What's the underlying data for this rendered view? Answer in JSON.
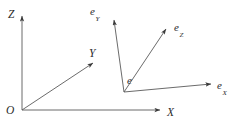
{
  "figure": {
    "type": "diagram",
    "background_color": "#ffffff",
    "line_color": "#555555",
    "text_color": "#2b2b2b",
    "width": 238,
    "height": 131
  },
  "global_frame": {
    "origin": {
      "label": "O",
      "x": 22,
      "y": 110
    },
    "axes": [
      {
        "name": "z-axis",
        "label": "Z",
        "subscript": "",
        "from": [
          22,
          110
        ],
        "to": [
          22,
          16
        ],
        "label_x": 8,
        "label_y": 5
      },
      {
        "name": "y-axis",
        "label": "Y",
        "subscript": "",
        "from": [
          22,
          110
        ],
        "to": [
          93,
          63
        ],
        "label_x": 89,
        "label_y": 44
      },
      {
        "name": "x-axis",
        "label": "X",
        "subscript": "",
        "from": [
          22,
          110
        ],
        "to": [
          160,
          110
        ],
        "label_x": 167,
        "label_y": 103
      }
    ]
  },
  "local_frame": {
    "origin": {
      "label": "e",
      "subscript": "",
      "x": 124,
      "y": 92,
      "label_x": 127,
      "label_y": 71
    },
    "vectors": [
      {
        "name": "e-y-vector",
        "label": "e",
        "subscript": "Y",
        "from": [
          124,
          92
        ],
        "to": [
          114,
          20
        ],
        "label_x": 90,
        "label_y": 2
      },
      {
        "name": "e-z-vector",
        "label": "e",
        "subscript": "Z",
        "from": [
          124,
          92
        ],
        "to": [
          166,
          29
        ],
        "label_x": 174,
        "label_y": 18
      },
      {
        "name": "e-x-vector",
        "label": "e",
        "subscript": "X",
        "from": [
          124,
          92
        ],
        "to": [
          211,
          84
        ],
        "label_x": 217,
        "label_y": 76
      }
    ]
  }
}
